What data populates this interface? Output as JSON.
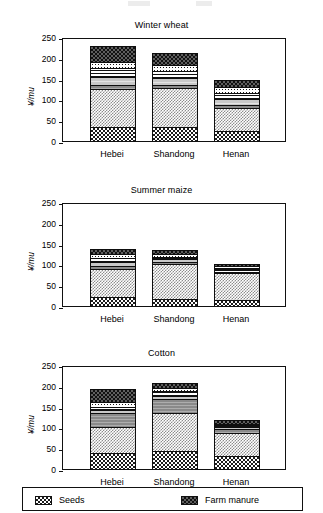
{
  "figure": {
    "ylabel": "¥/mu",
    "categories": [
      "Hebei",
      "Shandong",
      "Henan"
    ],
    "yticks": [
      "0",
      "50",
      "100",
      "150",
      "200",
      "250"
    ]
  },
  "legend": {
    "items": [
      {
        "label": "Seeds",
        "pattern": "dark-checker-icon"
      },
      {
        "label": "Farm manure",
        "pattern": "coarse-checker-icon"
      }
    ]
  },
  "chart_data": [
    {
      "type": "bar",
      "stacked": true,
      "title": "Winter wheat",
      "xlabel": "",
      "ylabel": "¥/mu",
      "ylim": [
        0,
        250
      ],
      "yticks": [
        0,
        50,
        100,
        150,
        200,
        250
      ],
      "grid": false,
      "legend_position": "bottom",
      "categories": [
        "Hebei",
        "Shandong",
        "Henan"
      ],
      "series": [
        {
          "name": "Seeds",
          "values": [
            33,
            33,
            25
          ]
        },
        {
          "name": "Fertilizer",
          "values": [
            92,
            94,
            55
          ]
        },
        {
          "name": "Pesticide",
          "values": [
            10,
            8,
            6
          ]
        },
        {
          "name": "Irrigation",
          "values": [
            20,
            17,
            14
          ]
        },
        {
          "name": "Machinery",
          "values": [
            20,
            17,
            16
          ]
        },
        {
          "name": "Plastic film",
          "values": [
            16,
            14,
            14
          ]
        },
        {
          "name": "Farm manure",
          "values": [
            38,
            29,
            16
          ]
        }
      ],
      "totals": [
        229,
        212,
        146
      ]
    },
    {
      "type": "bar",
      "stacked": true,
      "title": "Summer maize",
      "xlabel": "",
      "ylabel": "¥/mu",
      "ylim": [
        0,
        250
      ],
      "yticks": [
        0,
        50,
        100,
        150,
        200,
        250
      ],
      "grid": false,
      "legend_position": "bottom",
      "categories": [
        "Hebei",
        "Shandong",
        "Henan"
      ],
      "series": [
        {
          "name": "Seeds",
          "values": [
            22,
            18,
            15
          ]
        },
        {
          "name": "Fertilizer",
          "values": [
            68,
            84,
            65
          ]
        },
        {
          "name": "Pesticide",
          "values": [
            6,
            5,
            3
          ]
        },
        {
          "name": "Irrigation",
          "values": [
            10,
            5,
            4
          ]
        },
        {
          "name": "Machinery",
          "values": [
            10,
            7,
            5
          ]
        },
        {
          "name": "Plastic film",
          "values": [
            8,
            6,
            4
          ]
        },
        {
          "name": "Farm manure",
          "values": [
            13,
            9,
            6
          ]
        }
      ],
      "totals": [
        137,
        134,
        102
      ]
    },
    {
      "type": "bar",
      "stacked": true,
      "title": "Cotton",
      "xlabel": "",
      "ylabel": "¥/mu",
      "ylim": [
        0,
        250
      ],
      "yticks": [
        0,
        50,
        100,
        150,
        200,
        250
      ],
      "grid": false,
      "legend_position": "bottom",
      "categories": [
        "Hebei",
        "Shandong",
        "Henan"
      ],
      "series": [
        {
          "name": "Seeds",
          "values": [
            38,
            44,
            31
          ]
        },
        {
          "name": "Fertilizer",
          "values": [
            63,
            90,
            55
          ]
        },
        {
          "name": "Pesticide",
          "values": [
            33,
            34,
            10
          ]
        },
        {
          "name": "Irrigation",
          "values": [
            9,
            8,
            5
          ]
        },
        {
          "name": "Machinery",
          "values": [
            7,
            11,
            4
          ]
        },
        {
          "name": "Plastic film",
          "values": [
            10,
            7,
            4
          ]
        },
        {
          "name": "Farm manure",
          "values": [
            33,
            12,
            10
          ]
        }
      ],
      "totals": [
        193,
        206,
        119
      ]
    }
  ]
}
